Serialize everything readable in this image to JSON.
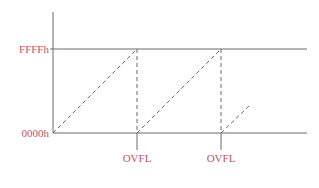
{
  "diagram": {
    "type": "sawtooth-timer",
    "y_labels": {
      "top": "FFFFh",
      "bottom": "0000h"
    },
    "x_labels": [
      {
        "label": "OVFL"
      },
      {
        "label": "OVFL"
      }
    ],
    "colors": {
      "lines": "#6a6a6a",
      "labels": "#c8506a"
    }
  }
}
